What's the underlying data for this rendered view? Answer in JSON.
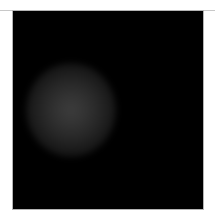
{
  "image": {
    "description": "Black square render with a faint soft gray circular glow left of center",
    "background_color": "#000000",
    "glow_color": "#3c3c3c",
    "frame_color": "#b4b4b4",
    "page_background": "#ffffff"
  }
}
